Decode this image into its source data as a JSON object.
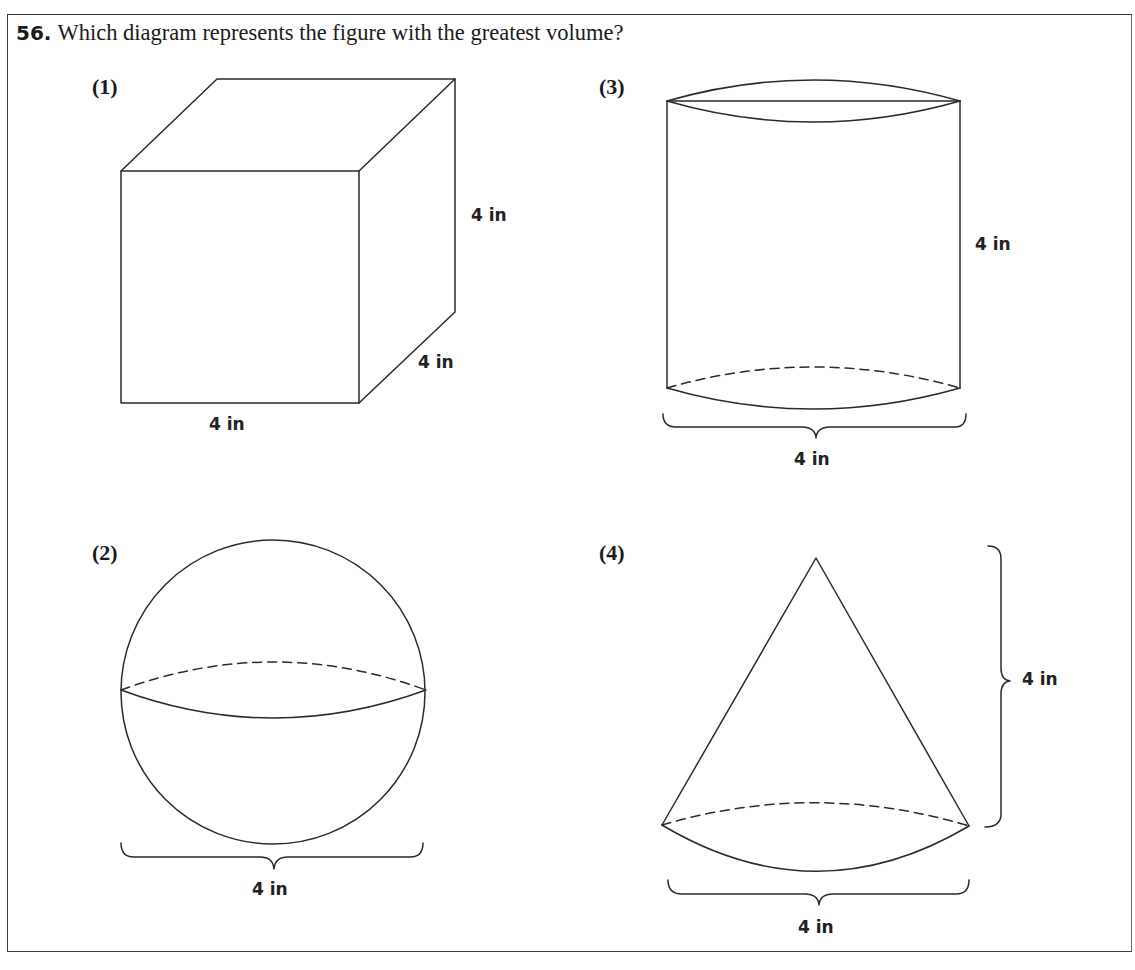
{
  "question": {
    "number": "56.",
    "text": "Which diagram represents the figure with the greatest volume?"
  },
  "options": [
    {
      "label": "(1)",
      "shape": "cube",
      "dimensions": {
        "height": "4 in",
        "depth": "4 in",
        "width": "4 in"
      }
    },
    {
      "label": "(2)",
      "shape": "sphere",
      "dimensions": {
        "diameter": "4 in"
      }
    },
    {
      "label": "(3)",
      "shape": "cylinder",
      "dimensions": {
        "height": "4 in",
        "diameter": "4 in"
      }
    },
    {
      "label": "(4)",
      "shape": "cone",
      "dimensions": {
        "height": "4 in",
        "diameter": "4 in"
      }
    }
  ],
  "style": {
    "line_color": "#2a2a2a",
    "text_color": "#1a1a1a",
    "background": "#ffffff"
  }
}
